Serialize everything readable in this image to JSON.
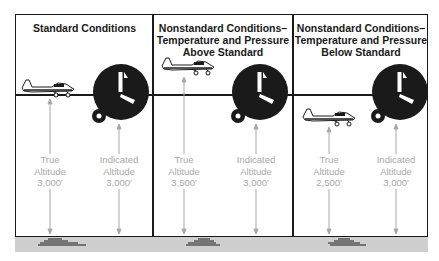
{
  "panels": [
    {
      "title": "Standard Conditions",
      "true_altitude": {
        "label_line1": "True",
        "label_line2": "Altitude",
        "value": "3,000′"
      },
      "indicated_altitude": {
        "label_line1": "Indicated",
        "label_line2": "Altitude",
        "value": "3,000′"
      }
    },
    {
      "title_line1": "Nonstandard Conditions–",
      "title_line2": "Temperature and Pressure",
      "title_line3": "Above Standard",
      "true_altitude": {
        "label_line1": "True",
        "label_line2": "Altitude",
        "value": "3,500′"
      },
      "indicated_altitude": {
        "label_line1": "Indicated",
        "label_line2": "Altitude",
        "value": "3,000′"
      }
    },
    {
      "title_line1": "Nonstandard Conditions–",
      "title_line2": "Temperature and Pressure",
      "title_line3": "Below Standard",
      "true_altitude": {
        "label_line1": "True",
        "label_line2": "Altitude",
        "value": "2,500′"
      },
      "indicated_altitude": {
        "label_line1": "Indicated",
        "label_line2": "Altitude",
        "value": "3,000′"
      }
    }
  ],
  "colors": {
    "ink": "#1a1a1a",
    "label_gray": "#a8a8a8",
    "ground": "#cfcfcf"
  }
}
